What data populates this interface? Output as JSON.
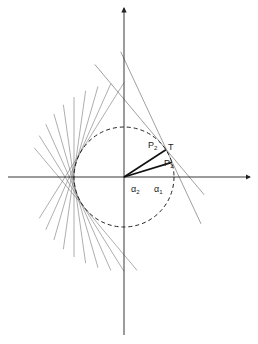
{
  "diagram": {
    "type": "tangent lines to a circle",
    "origin": [
      124,
      177
    ],
    "radius": 50,
    "labels": {
      "p2": "P",
      "p2_sub": "2",
      "p1": "P",
      "p1_sub": "1",
      "t": "T",
      "alpha2": "α",
      "alpha2_sub": "2",
      "alpha1": "α",
      "alpha1_sub": "1"
    },
    "angles_deg": {
      "alpha1": 17,
      "alpha2": 33
    },
    "left_tangent_angles_deg": [
      148,
      156,
      164,
      172,
      180,
      188,
      196,
      204,
      212,
      220
    ],
    "right_tangent_angles_deg": [
      25,
      40
    ],
    "colors": {
      "stroke": "#222222",
      "thin": "#666666"
    }
  }
}
